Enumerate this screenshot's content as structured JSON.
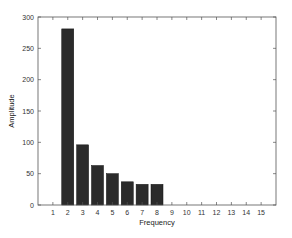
{
  "chart_data": {
    "type": "bar",
    "title": "",
    "xlabel": "Frequency",
    "ylabel": "Amplitude",
    "categories": [
      1,
      2,
      3,
      4,
      5,
      6,
      7,
      8,
      9,
      10,
      11,
      12,
      13,
      14,
      15
    ],
    "values": [
      0,
      281,
      96,
      63,
      50,
      37,
      33,
      33,
      0,
      0,
      0,
      0,
      0,
      0,
      0
    ],
    "xlim": [
      0,
      16
    ],
    "ylim": [
      0,
      300
    ],
    "xticks": [
      1,
      2,
      3,
      4,
      5,
      6,
      7,
      8,
      9,
      10,
      11,
      12,
      13,
      14,
      15
    ],
    "yticks": [
      0,
      50,
      100,
      150,
      200,
      250,
      300
    ],
    "grid": false,
    "legend": null,
    "bar_color": "#2b2b2b"
  }
}
